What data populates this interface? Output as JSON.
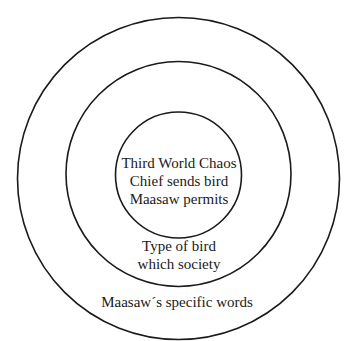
{
  "diagram": {
    "type": "concentric-circles",
    "rings": [
      {
        "id": "inner",
        "lines": [
          "Third World Chaos",
          "Chief sends bird",
          "Maasaw permits"
        ]
      },
      {
        "id": "middle",
        "lines": [
          "Type of bird",
          "which society"
        ]
      },
      {
        "id": "outer",
        "lines": [
          "Maasaw´s specific words"
        ]
      }
    ],
    "colors": {
      "stroke": "#1a1a1a",
      "background": "#ffffff",
      "text": "#1a1a1a"
    }
  }
}
